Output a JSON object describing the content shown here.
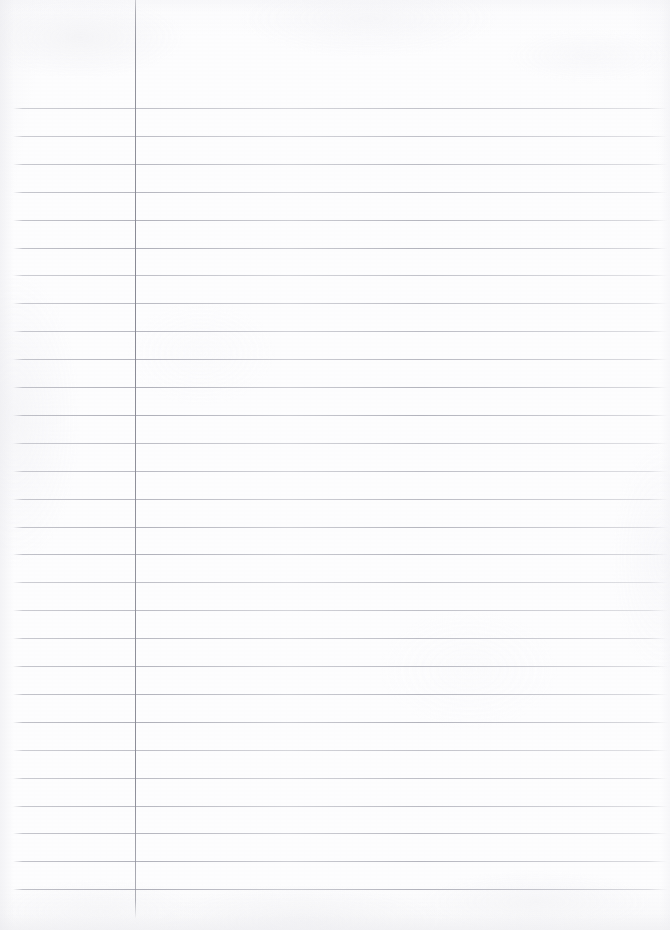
{
  "document": {
    "kind": "scanned-ruled-notebook-page",
    "page_width": 670,
    "page_height": 930,
    "content_text": "",
    "has_handwriting": false,
    "paper_color": "#fdfdfe",
    "rule_line_color": "#aaabb4",
    "margin_rule_color": "#8a8b96"
  },
  "margin_rule": {
    "x": 135,
    "top": 0,
    "bottom": 919,
    "width": 1.4
  },
  "ruling": {
    "line_start_x": 13,
    "line_end_x": 668,
    "first_line_y": 108,
    "spacing": 27.9,
    "count": 29,
    "lines_y": [
      108,
      135.9,
      163.8,
      191.7,
      219.6,
      247.5,
      275.4,
      303.3,
      331.2,
      359.1,
      387.0,
      414.9,
      442.8,
      470.7,
      498.6,
      526.5,
      554.4,
      582.3,
      610.2,
      638.1,
      666.0,
      693.9,
      721.8,
      749.7,
      777.6,
      805.5,
      833.4,
      861.3,
      889.2
    ]
  }
}
